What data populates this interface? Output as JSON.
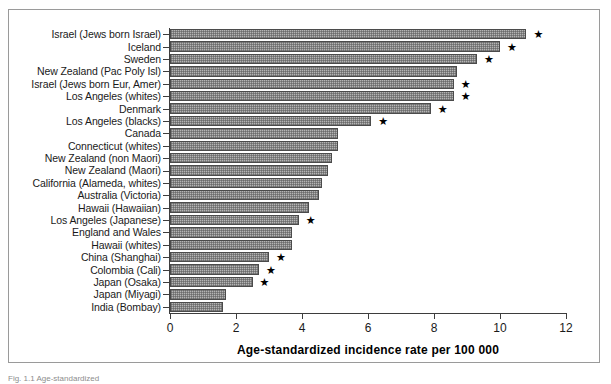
{
  "figure": {
    "caption": "Fig. 1.1 Age-standardized"
  },
  "chart_data": {
    "type": "bar",
    "orientation": "horizontal",
    "title": "",
    "xlabel": "Age-standardized incidence rate per 100 000",
    "ylabel": "",
    "xlim": [
      0,
      12
    ],
    "xticks": [
      0,
      2,
      4,
      6,
      8,
      10,
      12
    ],
    "grid": false,
    "legend": null,
    "annotation_marker": "★",
    "categories": [
      "Israel (Jews born Israel)",
      "Iceland",
      "Sweden",
      "New Zealand (Pac Poly Isl)",
      "Israel (Jews born Eur, Amer)",
      "Los Angeles (whites)",
      "Denmark",
      "Los Angeles (blacks)",
      "Canada",
      "Connecticut (whites)",
      "New Zealand (non Maori)",
      "New Zealand (Maori)",
      "California (Alameda, whites)",
      "Australia (Victoria)",
      "Hawaii (Hawaiian)",
      "Los Angeles (Japanese)",
      "England and Wales",
      "Hawaii (whites)",
      "China (Shanghai)",
      "Colombia (Cali)",
      "Japan (Osaka)",
      "Japan (Miyagi)",
      "India (Bombay)"
    ],
    "values": [
      10.8,
      10.0,
      9.3,
      8.7,
      8.6,
      8.6,
      7.9,
      6.1,
      5.1,
      5.1,
      4.9,
      4.8,
      4.6,
      4.5,
      4.2,
      3.9,
      3.7,
      3.7,
      3.0,
      2.7,
      2.5,
      1.7,
      1.6
    ],
    "starred": [
      true,
      true,
      true,
      false,
      true,
      true,
      true,
      true,
      false,
      false,
      false,
      false,
      false,
      false,
      false,
      true,
      false,
      false,
      true,
      true,
      true,
      false,
      false
    ]
  }
}
